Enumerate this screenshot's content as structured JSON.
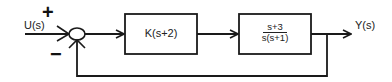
{
  "diagram": {
    "type": "feedback-control-block-diagram",
    "input": {
      "label": "U(s)"
    },
    "output": {
      "label": "Y(s)"
    },
    "summing_junction": {
      "plus_sign": "+",
      "minus_sign": "−"
    },
    "blocks": [
      {
        "id": "controller",
        "text": "K(s+2)"
      },
      {
        "id": "plant",
        "numerator": "s+3",
        "denominator": "s(s+1)"
      }
    ],
    "feedback": {
      "type": "unity",
      "sign": "negative"
    },
    "colors": {
      "line": "#1a1a1a",
      "background": "#ffffff"
    }
  }
}
